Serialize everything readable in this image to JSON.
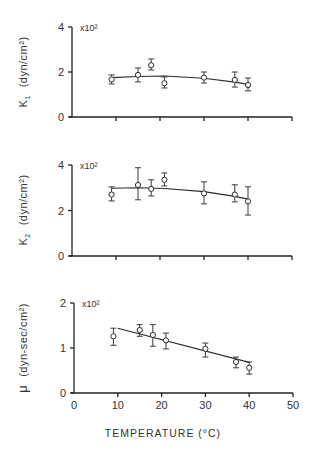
{
  "chart_data": [
    {
      "type": "scatter",
      "panel": "top",
      "title": "",
      "ylabel_symbol": "K",
      "ylabel_subscript": "1",
      "ylabel_units": "(dyn/cm²)",
      "y_multiplier": "x10²",
      "ylim": [
        0,
        4
      ],
      "yticks": [
        0,
        2,
        4
      ],
      "xlim": [
        0,
        50
      ],
      "xticks": [
        0,
        10,
        20,
        30,
        40,
        50
      ],
      "show_xtick_labels": false,
      "grid": false,
      "series": [
        {
          "name": "K1 measured",
          "marker": "open-circle",
          "x": [
            9,
            15,
            18,
            21,
            30,
            37,
            40
          ],
          "y": [
            1.67,
            1.87,
            2.3,
            1.5,
            1.75,
            1.65,
            1.42
          ],
          "err_low": [
            1.47,
            1.56,
            2.09,
            1.29,
            1.51,
            1.33,
            1.16
          ],
          "err_high": [
            1.87,
            2.18,
            2.58,
            1.78,
            2.0,
            2.0,
            1.73
          ]
        },
        {
          "name": "K1 fit",
          "type": "line",
          "x": [
            9,
            15,
            21,
            30,
            37,
            40
          ],
          "y": [
            1.75,
            1.8,
            1.82,
            1.72,
            1.55,
            1.45
          ]
        }
      ]
    },
    {
      "type": "scatter",
      "panel": "middle",
      "title": "",
      "ylabel_symbol": "K",
      "ylabel_subscript": "2",
      "ylabel_units": "(dyn/cm²)",
      "y_multiplier": "x10²",
      "ylim": [
        0,
        4
      ],
      "yticks": [
        0,
        2,
        4
      ],
      "xlim": [
        0,
        50
      ],
      "xticks": [
        0,
        10,
        20,
        30,
        40,
        50
      ],
      "show_xtick_labels": false,
      "grid": false,
      "series": [
        {
          "name": "K2 measured",
          "marker": "open-circle",
          "x": [
            9,
            15,
            18,
            21,
            30,
            37,
            40
          ],
          "y": [
            2.7,
            3.12,
            2.95,
            3.35,
            2.75,
            2.7,
            2.4
          ],
          "err_low": [
            2.42,
            2.47,
            2.64,
            3.08,
            2.29,
            2.38,
            1.8
          ],
          "err_high": [
            3.04,
            3.88,
            3.35,
            3.65,
            3.26,
            3.13,
            3.04
          ]
        },
        {
          "name": "K2 fit",
          "type": "line",
          "x": [
            9,
            15,
            21,
            30,
            37,
            40
          ],
          "y": [
            2.98,
            3.0,
            2.97,
            2.83,
            2.62,
            2.5
          ]
        }
      ]
    },
    {
      "type": "scatter",
      "panel": "bottom",
      "title": "",
      "ylabel_symbol": "μ",
      "ylabel_subscript": "",
      "ylabel_units": "(dyn-sec/cm²)",
      "y_multiplier": "x10²",
      "ylim": [
        0,
        2
      ],
      "yticks": [
        0,
        1,
        2
      ],
      "xlim": [
        0,
        50
      ],
      "xticks": [
        0,
        10,
        20,
        30,
        40,
        50
      ],
      "show_xtick_labels": true,
      "xlabel": "TEMPERATURE (°C)",
      "grid": false,
      "series": [
        {
          "name": "μ measured",
          "marker": "open-circle",
          "x": [
            9,
            15,
            18,
            21,
            30,
            37,
            40
          ],
          "y": [
            1.26,
            1.4,
            1.29,
            1.17,
            0.98,
            0.69,
            0.56
          ],
          "err_low": [
            1.06,
            1.26,
            1.04,
            0.98,
            0.8,
            0.56,
            0.42
          ],
          "err_high": [
            1.44,
            1.52,
            1.52,
            1.33,
            1.11,
            0.8,
            0.69
          ]
        },
        {
          "name": "μ fit",
          "type": "line",
          "x": [
            10,
            40
          ],
          "y": [
            1.44,
            0.68
          ]
        }
      ]
    }
  ],
  "figure": {
    "xlabel": "TEMPERATURE (°C)",
    "panel_labels": {
      "top_symbol": "K",
      "top_sub": "1",
      "top_units": "(dyn/cm²)",
      "mid_symbol": "K",
      "mid_sub": "2",
      "mid_units": "(dyn/cm²)",
      "bot_symbol": "μ",
      "bot_units": "(dyn-sec/cm²)",
      "multiplier": "x10²"
    },
    "colors": {
      "background": "#ffffff",
      "ink": "#222222",
      "text": "#333333"
    }
  }
}
